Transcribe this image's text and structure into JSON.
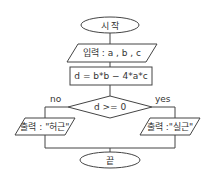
{
  "diagram": {
    "type": "flowchart",
    "nodes": {
      "start": {
        "shape": "terminal",
        "label": "시 작"
      },
      "input": {
        "shape": "io",
        "label": "입력 : a , b , c"
      },
      "compute": {
        "shape": "process",
        "label": "d = b*b − 4*a*c"
      },
      "decision": {
        "shape": "decision",
        "label": "d >= 0"
      },
      "output_no": {
        "shape": "io",
        "label": "출력 : \"허근\""
      },
      "output_yes": {
        "shape": "io",
        "label": "출력 :\"실근\""
      },
      "end": {
        "shape": "terminal",
        "label": "끝"
      }
    },
    "edges": {
      "no_label": "no",
      "yes_label": "yes"
    },
    "colors": {
      "stroke": "#444444",
      "text": "#333333",
      "background": "#ffffff"
    }
  }
}
